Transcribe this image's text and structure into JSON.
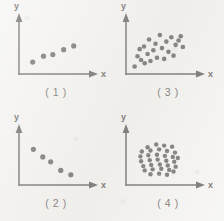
{
  "figure": {
    "background_color": "#f2f1ee",
    "ink_color": "#343130",
    "axis_color": "#2b2928",
    "axis_labels": {
      "x": "x",
      "y": "y"
    }
  },
  "chart_data": [
    {
      "type": "scatter",
      "title": "( 1 )",
      "caption": "( 1 )",
      "xlabel": "x",
      "ylabel": "y",
      "xlim": [
        0,
        10
      ],
      "ylim": [
        0,
        10
      ],
      "grid": false,
      "legend": "none",
      "pattern": "strong positive linear correlation",
      "point_count": 5,
      "points": [
        {
          "x": 1.9,
          "y": 2.2
        },
        {
          "x": 3.4,
          "y": 3.3
        },
        {
          "x": 4.7,
          "y": 3.6
        },
        {
          "x": 6.2,
          "y": 4.5
        },
        {
          "x": 7.6,
          "y": 5.2
        }
      ]
    },
    {
      "type": "scatter",
      "title": "( 3 )",
      "caption": "( 3 )",
      "xlabel": "x",
      "ylabel": "y",
      "xlim": [
        0,
        10
      ],
      "ylim": [
        0,
        10
      ],
      "grid": false,
      "legend": "none",
      "pattern": "moderate positive correlation, diffuse cloud",
      "point_count": 23,
      "points": [
        {
          "x": 1.2,
          "y": 1.4
        },
        {
          "x": 1.6,
          "y": 3.3
        },
        {
          "x": 1.9,
          "y": 4.6
        },
        {
          "x": 2.1,
          "y": 2.6
        },
        {
          "x": 2.5,
          "y": 5.1
        },
        {
          "x": 2.6,
          "y": 2.0
        },
        {
          "x": 3.0,
          "y": 3.7
        },
        {
          "x": 3.2,
          "y": 6.4
        },
        {
          "x": 3.4,
          "y": 2.4
        },
        {
          "x": 3.8,
          "y": 4.4
        },
        {
          "x": 4.1,
          "y": 5.6
        },
        {
          "x": 4.3,
          "y": 3.0
        },
        {
          "x": 4.7,
          "y": 7.2
        },
        {
          "x": 5.0,
          "y": 4.8
        },
        {
          "x": 5.3,
          "y": 2.8
        },
        {
          "x": 5.6,
          "y": 6.0
        },
        {
          "x": 5.9,
          "y": 4.1
        },
        {
          "x": 6.3,
          "y": 6.8
        },
        {
          "x": 6.6,
          "y": 3.4
        },
        {
          "x": 6.9,
          "y": 5.4
        },
        {
          "x": 7.3,
          "y": 6.2
        },
        {
          "x": 7.6,
          "y": 7.0
        },
        {
          "x": 7.9,
          "y": 5.0
        }
      ]
    },
    {
      "type": "scatter",
      "title": "( 2 )",
      "caption": "( 2 )",
      "xlabel": "x",
      "ylabel": "y",
      "xlim": [
        0,
        10
      ],
      "ylim": [
        0,
        10
      ],
      "grid": false,
      "legend": "none",
      "pattern": "strong negative correlation",
      "point_count": 5,
      "points": [
        {
          "x": 2.0,
          "y": 6.6
        },
        {
          "x": 3.3,
          "y": 5.2
        },
        {
          "x": 4.4,
          "y": 4.3
        },
        {
          "x": 5.8,
          "y": 2.7
        },
        {
          "x": 7.2,
          "y": 1.9
        }
      ]
    },
    {
      "type": "scatter",
      "title": "( 4 )",
      "caption": "( 4 )",
      "xlabel": "x",
      "ylabel": "y",
      "xlim": [
        0,
        10
      ],
      "ylim": [
        0,
        10
      ],
      "grid": false,
      "legend": "none",
      "pattern": "no correlation, dense circular cluster",
      "point_count": 33,
      "points": [
        {
          "x": 3.0,
          "y": 7.0
        },
        {
          "x": 4.2,
          "y": 7.5
        },
        {
          "x": 5.3,
          "y": 7.3
        },
        {
          "x": 6.4,
          "y": 7.1
        },
        {
          "x": 2.2,
          "y": 6.2
        },
        {
          "x": 3.4,
          "y": 6.4
        },
        {
          "x": 4.6,
          "y": 6.6
        },
        {
          "x": 5.7,
          "y": 6.3
        },
        {
          "x": 6.8,
          "y": 6.0
        },
        {
          "x": 2.0,
          "y": 5.3
        },
        {
          "x": 3.1,
          "y": 5.5
        },
        {
          "x": 4.3,
          "y": 5.6
        },
        {
          "x": 5.4,
          "y": 5.4
        },
        {
          "x": 6.5,
          "y": 5.2
        },
        {
          "x": 7.2,
          "y": 5.0
        },
        {
          "x": 2.1,
          "y": 4.4
        },
        {
          "x": 3.3,
          "y": 4.6
        },
        {
          "x": 4.4,
          "y": 4.7
        },
        {
          "x": 5.6,
          "y": 4.5
        },
        {
          "x": 6.7,
          "y": 4.3
        },
        {
          "x": 2.4,
          "y": 3.5
        },
        {
          "x": 3.5,
          "y": 3.7
        },
        {
          "x": 4.7,
          "y": 3.8
        },
        {
          "x": 5.8,
          "y": 3.6
        },
        {
          "x": 6.9,
          "y": 3.4
        },
        {
          "x": 2.6,
          "y": 2.7
        },
        {
          "x": 3.7,
          "y": 2.9
        },
        {
          "x": 4.9,
          "y": 3.0
        },
        {
          "x": 6.0,
          "y": 2.8
        },
        {
          "x": 6.6,
          "y": 2.5
        },
        {
          "x": 3.4,
          "y": 2.0
        },
        {
          "x": 4.6,
          "y": 2.1
        },
        {
          "x": 5.7,
          "y": 1.9
        }
      ]
    }
  ]
}
